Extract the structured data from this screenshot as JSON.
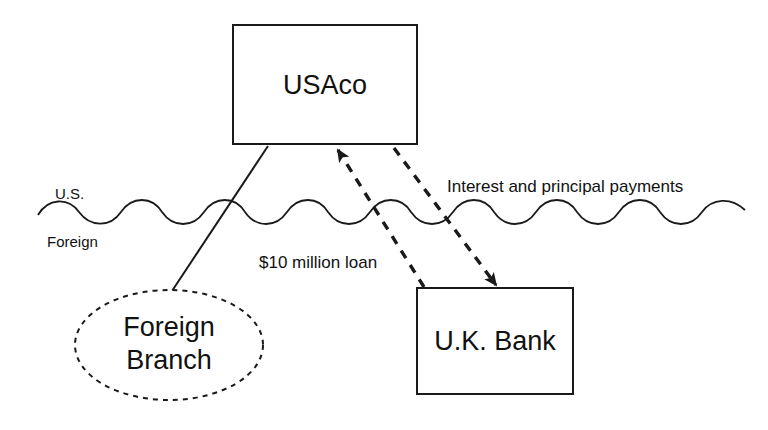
{
  "diagram": {
    "nodes": {
      "usaco": {
        "label": "USAco",
        "shape": "rectangle",
        "border_style": "solid"
      },
      "foreign_branch": {
        "label_line1": "Foreign",
        "label_line2": "Branch",
        "shape": "ellipse",
        "border_style": "dashed"
      },
      "uk_bank": {
        "label": "U.K. Bank",
        "shape": "rectangle",
        "border_style": "solid"
      }
    },
    "border_labels": {
      "upper": "U.S.",
      "lower": "Foreign"
    },
    "edges": {
      "loan": {
        "label": "$10 million loan",
        "style": "dashed",
        "from": "uk_bank",
        "to": "usaco",
        "arrowhead": "to-usaco"
      },
      "repayment": {
        "label": "Interest and principal payments",
        "style": "dashed",
        "from": "usaco",
        "to": "uk_bank",
        "arrowhead": "to-uk-bank"
      },
      "branch_link": {
        "label": "",
        "style": "solid",
        "from": "usaco",
        "to": "foreign_branch",
        "arrowhead": "none"
      }
    },
    "colors": {
      "stroke": "#1a1a1a",
      "background": "#ffffff",
      "text": "#111111"
    }
  }
}
